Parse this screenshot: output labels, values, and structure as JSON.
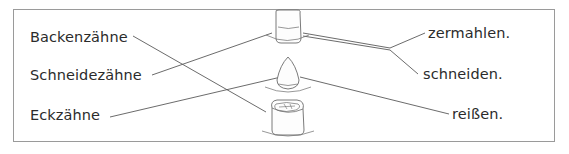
{
  "worksheet": {
    "title": "Zahnarten und ihre Funktionen",
    "border_color": "#9a9a9a",
    "background_color": "#ffffff",
    "ink_color": "#5a5a5a",
    "text_color": "#2b2b2b"
  },
  "left_labels": [
    {
      "id": "backenzaehne",
      "text": "Backenzähne"
    },
    {
      "id": "schneidezaehne",
      "text": "Schneidezähne"
    },
    {
      "id": "eckzaehne",
      "text": "Eckzähne"
    }
  ],
  "right_labels": [
    {
      "id": "zermahlen",
      "text": "zermahlen."
    },
    {
      "id": "schneiden",
      "text": "schneiden."
    },
    {
      "id": "reissen",
      "text": "reißen."
    }
  ],
  "tooth_illustrations": [
    {
      "id": "molar-top",
      "name": "molar-tooth",
      "position": "top"
    },
    {
      "id": "canine-middle",
      "name": "canine-tooth",
      "position": "middle"
    },
    {
      "id": "molar-bottom",
      "name": "molar-occlusal-tooth",
      "position": "bottom"
    }
  ],
  "connector_lines": [
    {
      "id": "line-backenzaehne",
      "from": "Backenzähne",
      "to": "bottom tooth"
    },
    {
      "id": "line-schneidezaehne",
      "from": "Schneidezähne",
      "to": "top tooth"
    },
    {
      "id": "line-eckzaehne",
      "from": "Eckzähne",
      "to": "middle tooth"
    },
    {
      "id": "line-zermahlen",
      "from": "top tooth",
      "to": "zermahlen."
    },
    {
      "id": "line-schneiden",
      "from": "top tooth",
      "to": "schneiden."
    },
    {
      "id": "line-reissen",
      "from": "middle tooth",
      "to": "reißen."
    }
  ]
}
